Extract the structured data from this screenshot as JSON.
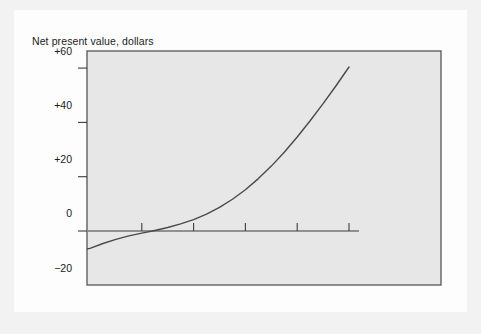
{
  "chart_data": {
    "type": "line",
    "title": "",
    "xlabel": "Discount rate, percent",
    "xlabel_line1": "Discount rate,",
    "xlabel_line2": "percent",
    "ylabel": "Net present value, dollars",
    "xlim": [
      -1,
      112
    ],
    "ylim": [
      -20,
      63
    ],
    "grid": false,
    "legend": null,
    "xticks": [
      20,
      40,
      60,
      80,
      100
    ],
    "xtick_labels": [
      "20",
      "40",
      "60",
      "80",
      "100"
    ],
    "yticks": [
      -20,
      0,
      20,
      40,
      60
    ],
    "ytick_labels": [
      "−20",
      "0",
      "+20",
      "+40",
      "+60"
    ],
    "series": [
      {
        "name": "Net present value",
        "x": [
          -1,
          0,
          5,
          10,
          15,
          20,
          25,
          30,
          35,
          40,
          45,
          50,
          55,
          60,
          65,
          70,
          75,
          80,
          85,
          90,
          95,
          100
        ],
        "y": [
          -6.6,
          -6.4,
          -4.6,
          -3.1,
          -1.8,
          -0.8,
          0.2,
          1.3,
          2.6,
          4.2,
          6.2,
          8.7,
          11.7,
          15.2,
          19.3,
          23.9,
          29.0,
          34.6,
          40.6,
          46.9,
          53.5,
          60.4
        ]
      }
    ],
    "colors": {
      "curve": "#4a4a4a",
      "axis": "#3d3d3d",
      "frame": "#555555",
      "plot_background": "#e7e7e7",
      "card_background": "#fdfdfd",
      "page_background": "#f2f2f2",
      "text": "#1b1b1b"
    },
    "zero_crossing_x": 24
  }
}
